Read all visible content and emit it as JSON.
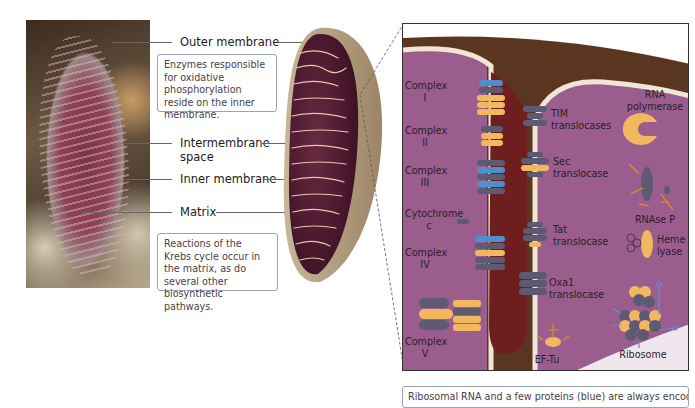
{
  "figure": {
    "micrograph": {
      "description": "electron-micrograph-of-mitochondrion"
    },
    "labels": {
      "outer_membrane": "Outer membrane",
      "intermembrane_space_line1": "Intermembrane",
      "intermembrane_space_line2": "space",
      "inner_membrane": "Inner membrane",
      "matrix": "Matrix"
    },
    "callouts": {
      "top": "Enzymes responsible for oxidative phosphorylation reside on the inner membrane.",
      "bottom": "Reactions of the Krebs cycle occur in the matrix, as do several other biosynthetic pathways.",
      "footer": "Ribosomal RNA and a few proteins (blue) are always encoded"
    },
    "detail_panel": {
      "left_labels": [
        {
          "l1": "Complex",
          "l2": "I"
        },
        {
          "l1": "Complex",
          "l2": "II"
        },
        {
          "l1": "Complex",
          "l2": "III"
        },
        {
          "l1": "Cytochrome",
          "l2": "c"
        },
        {
          "l1": "Complex",
          "l2": "IV"
        },
        {
          "l1": "Complex",
          "l2": "V"
        }
      ],
      "middle_labels": [
        {
          "l1": "TIM",
          "l2": "translocases"
        },
        {
          "l1": "Sec",
          "l2": "translocase"
        },
        {
          "l1": "Tat",
          "l2": "translocase"
        },
        {
          "l1": "Oxa1",
          "l2": "translocase"
        }
      ],
      "right_labels": {
        "rna_polymerase_l1": "RNA",
        "rna_polymerase_l2": "polymerase",
        "rnase_p": "RNAse P",
        "heme_lyase_l1": "Heme",
        "heme_lyase_l2": "lyase",
        "ribosome": "Ribosome",
        "ef_tu": "EF-Tu"
      },
      "colors": {
        "intermembrane_band": "#5a3520",
        "matrix_purple": "#9a5a8a",
        "inner_membrane": "#f1e6d6",
        "protein_grey": "#5e5a74",
        "protein_orange": "#f2b860",
        "protein_blue": "#4f8fd0",
        "crista_lumen": "#6e1e1e"
      }
    }
  }
}
